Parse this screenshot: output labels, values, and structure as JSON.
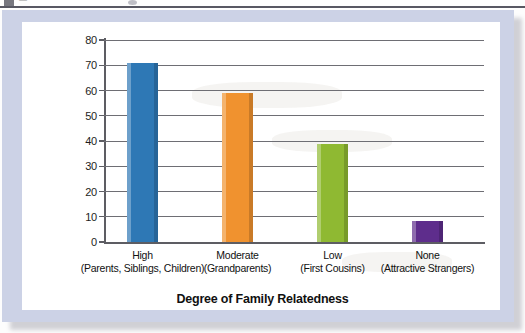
{
  "chart_data": {
    "type": "bar",
    "title": "",
    "xlabel": "Degree of Family Relatedness",
    "ylabel": "Percentage of Participants Volunteering to Help",
    "ylabel_line1": "Percentage of Participants",
    "ylabel_line2": "Volunteering to Help",
    "categories": [
      "High",
      "Moderate",
      "Low",
      "None"
    ],
    "category_sublabels": [
      "(Parents, Siblings, Children)",
      "(Grandparents)",
      "(First Cousins)",
      "(Attractive Strangers)"
    ],
    "values": [
      71,
      59,
      39,
      8.5
    ],
    "colors": [
      "#2E78B5",
      "#F0922F",
      "#8FB932",
      "#5E2D8C"
    ],
    "ylim": [
      0,
      80
    ],
    "ytick_labels": [
      "0",
      "10",
      "20",
      "30",
      "40",
      "50",
      "60",
      "70",
      "80"
    ],
    "ytick_values": [
      0,
      10,
      20,
      30,
      40,
      50,
      60,
      70,
      80
    ],
    "grid": true,
    "legend": "none",
    "bars": [
      {
        "category": "High",
        "sublabel": "(Parents, Siblings, Children)",
        "value": 71,
        "color": "#2E78B5"
      },
      {
        "category": "Moderate",
        "sublabel": "(Grandparents)",
        "value": 59,
        "color": "#F0922F"
      },
      {
        "category": "Low",
        "sublabel": "(First Cousins)",
        "value": 39,
        "color": "#8FB932"
      },
      {
        "category": "None",
        "sublabel": "(Attractive Strangers)",
        "value": 8.5,
        "color": "#5E2D8C"
      }
    ]
  },
  "figure": {
    "background_color": "#FFFFFF",
    "mount_color": "#CCD2E6",
    "axis_color": "#5D5D63",
    "grid_color": "#6E6E74",
    "text_color": "#111111"
  }
}
